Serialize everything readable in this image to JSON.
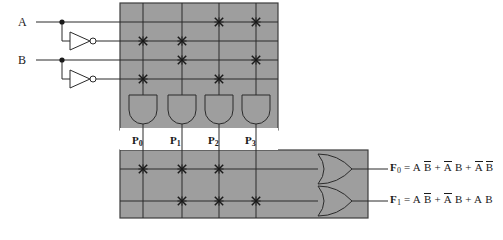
{
  "diagram": {
    "colors": {
      "plane_fill": "#9e9e9e",
      "plane_stroke": "#3d3d3d",
      "wire": "#2b2b2b",
      "text": "#1a1a1a",
      "background": "#ffffff"
    }
  },
  "inputs": [
    {
      "label": "A",
      "x": 22,
      "y": 25
    },
    {
      "label": "B",
      "x": 22,
      "y": 63
    }
  ],
  "input_lines": [
    {
      "name": "A",
      "row": 0,
      "y": 22,
      "literal": "A"
    },
    {
      "name": "Abar",
      "row": 1,
      "y": 41,
      "literal": "A-bar"
    },
    {
      "name": "B",
      "row": 2,
      "y": 60,
      "literal": "B"
    },
    {
      "name": "Bbar",
      "row": 3,
      "y": 79,
      "literal": "B-bar"
    }
  ],
  "inverters": [
    {
      "name": "inverter-a",
      "input": "A",
      "output": "Abar",
      "x": 70,
      "y": 41
    },
    {
      "name": "inverter-b",
      "input": "B",
      "output": "Bbar",
      "x": 70,
      "y": 79
    }
  ],
  "and_plane": {
    "label": "AND plane",
    "x": 120,
    "y": 3,
    "width": 158,
    "height": 127,
    "columns": [
      {
        "term": "P0",
        "x": 143
      },
      {
        "term": "P1",
        "x": 182
      },
      {
        "term": "P2",
        "x": 219
      },
      {
        "term": "P3",
        "x": 256
      }
    ],
    "connections": [
      {
        "column": "P0",
        "row": "Abar"
      },
      {
        "column": "P0",
        "row": "Bbar"
      },
      {
        "column": "P1",
        "row": "Abar"
      },
      {
        "column": "P1",
        "row": "B"
      },
      {
        "column": "P2",
        "row": "A"
      },
      {
        "column": "P2",
        "row": "Bbar"
      },
      {
        "column": "P3",
        "row": "A"
      },
      {
        "column": "P3",
        "row": "B"
      }
    ],
    "gates": [
      {
        "name": "and-gate-p0",
        "x": 143
      },
      {
        "name": "and-gate-p1",
        "x": 182
      },
      {
        "name": "and-gate-p2",
        "x": 219
      },
      {
        "name": "and-gate-p3",
        "x": 256
      }
    ]
  },
  "product_terms": [
    {
      "label": "P",
      "sub": "0",
      "x": 136,
      "y": 134,
      "expression": "A-bar B-bar"
    },
    {
      "label": "P",
      "sub": "1",
      "x": 174,
      "y": 134,
      "expression": "A-bar B"
    },
    {
      "label": "P",
      "sub": "2",
      "x": 212,
      "y": 134,
      "expression": "A B-bar"
    },
    {
      "label": "P",
      "sub": "3",
      "x": 249,
      "y": 134,
      "expression": "A B"
    }
  ],
  "or_plane": {
    "label": "OR plane",
    "x": 120,
    "y": 150,
    "width": 248,
    "height": 68,
    "rows": [
      {
        "output": "F0",
        "y": 169
      },
      {
        "output": "F1",
        "y": 201
      }
    ],
    "connections": [
      {
        "output": "F0",
        "column": "P0"
      },
      {
        "output": "F0",
        "column": "P1"
      },
      {
        "output": "F0",
        "column": "P2"
      },
      {
        "output": "F1",
        "column": "P1"
      },
      {
        "output": "F1",
        "column": "P2"
      },
      {
        "output": "F1",
        "column": "P3"
      }
    ],
    "gates": [
      {
        "name": "or-gate-f0",
        "y": 169
      },
      {
        "name": "or-gate-f1",
        "y": 201
      }
    ]
  },
  "outputs": [
    {
      "name": "F0",
      "label": "F",
      "sub": "0",
      "x": 393,
      "y": 162,
      "equation_plain": "F0 = A B-bar + A-bar B + A-bar B-bar",
      "terms": [
        {
          "a": "A",
          "a_bar": false,
          "b": "B",
          "b_bar": true
        },
        {
          "a": "A",
          "a_bar": true,
          "b": "B",
          "b_bar": false
        },
        {
          "a": "A",
          "a_bar": true,
          "b": "B",
          "b_bar": true
        }
      ]
    },
    {
      "name": "F1",
      "label": "F",
      "sub": "1",
      "x": 393,
      "y": 194,
      "equation_plain": "F1 = A B-bar + A-bar B + A B",
      "terms": [
        {
          "a": "A",
          "a_bar": false,
          "b": "B",
          "b_bar": true
        },
        {
          "a": "A",
          "a_bar": true,
          "b": "B",
          "b_bar": false
        },
        {
          "a": "A",
          "a_bar": false,
          "b": "B",
          "b_bar": false
        }
      ]
    }
  ]
}
